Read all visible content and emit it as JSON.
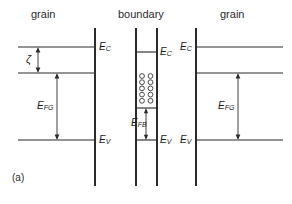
{
  "figure": {
    "panel_label": "(a)",
    "caption_region_labels": [
      "grain",
      "boundary",
      "grain"
    ],
    "headers": [
      {
        "text": "grain",
        "x": 47,
        "y": 14
      },
      {
        "text": "boundary",
        "x": 146,
        "y": 14
      },
      {
        "text": "grain",
        "x": 235,
        "y": 14
      }
    ],
    "energy_labels": {
      "ec_left_grain": {
        "text": "E",
        "sub": "C"
      },
      "ec_boundary": {
        "text": "E",
        "sub": "C"
      },
      "ec_right_grain": {
        "text": "E",
        "sub": "C"
      },
      "ev_left_grain": {
        "text": "E",
        "sub": "V"
      },
      "ev_boundary": {
        "text": "E",
        "sub": "V"
      },
      "ev_right_grain": {
        "text": "E",
        "sub": "V"
      },
      "efg_left": {
        "text": "E",
        "sub": "FG"
      },
      "efg_right": {
        "text": "E",
        "sub": "FG"
      },
      "efb": {
        "text": "E",
        "sub": "FB"
      },
      "zeta": {
        "text": "ζ"
      }
    },
    "geometry": {
      "vertical_boundaries_x": [
        95,
        136,
        157,
        196
      ],
      "vertical_top_y": 28,
      "vertical_bottom_y": 186,
      "conduction_band_y_grain": 47,
      "conduction_band_y_boundary": 52,
      "fermi_level_y_grain": 73,
      "trap_level_y_boundary": 108,
      "valence_band_y": 140,
      "left_grain_x_range": [
        18,
        95
      ],
      "right_grain_x_range": [
        196,
        283
      ],
      "boundary_x_range": [
        136,
        157
      ]
    },
    "trap_states": {
      "symbol": "open-circle",
      "columns": 2,
      "rows": 5,
      "count": 10,
      "radius": 2.4,
      "x_positions": [
        142,
        150.5
      ],
      "y_start": 76,
      "y_step": 6.2,
      "fill": "none",
      "stroke": "#2b2b2b"
    },
    "arrows": {
      "zeta": {
        "x": 38,
        "y_top": 47,
        "y_bottom": 73,
        "heads": "both"
      },
      "efg_left": {
        "x": 57,
        "y_top": 73,
        "y_bottom": 140,
        "heads": "both"
      },
      "efg_right": {
        "x": 238,
        "y_top": 73,
        "y_bottom": 140,
        "heads": "both"
      },
      "efb": {
        "x": 146,
        "y_top": 108,
        "y_bottom": 140,
        "heads": "both"
      }
    },
    "colors": {
      "line": "#2b2b2b",
      "text": "#1a1a1a",
      "background": "#ffffff"
    }
  }
}
